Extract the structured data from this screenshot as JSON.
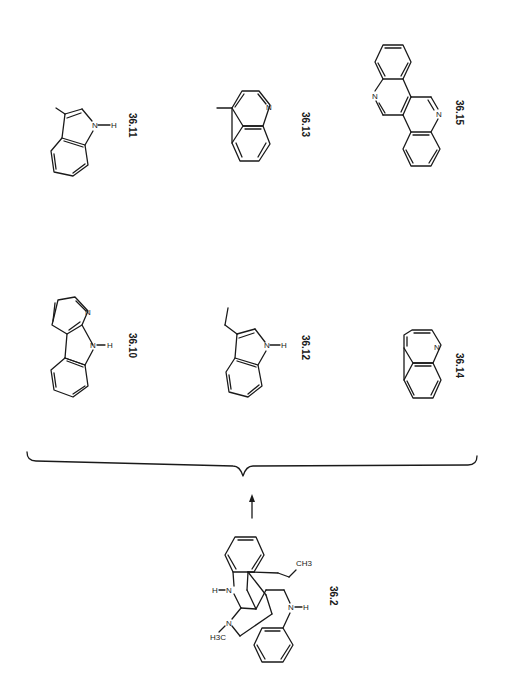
{
  "figure": {
    "orientation": "rotated-90-clockwise",
    "reactant": {
      "id": "36.2",
      "label": "36.2",
      "atoms": {
        "n1": "N",
        "h1": "H",
        "n2": "N",
        "h2": "H",
        "n3": "N",
        "n4": "N",
        "ch3_left": "H3C",
        "ch3_right": "CH3",
        "sub3": "3"
      }
    },
    "arrow": {
      "direction": "up"
    },
    "products": [
      {
        "id": "36.10",
        "label": "36.10",
        "name_hint": "alpha-carboline",
        "atoms": {
          "n_ring": "N",
          "n_h": "N",
          "h": "H"
        }
      },
      {
        "id": "36.11",
        "label": "36.11",
        "name_hint": "3-methylindole",
        "atoms": {
          "n": "N",
          "h": "H"
        }
      },
      {
        "id": "36.12",
        "label": "36.12",
        "name_hint": "3-ethylindole",
        "atoms": {
          "n": "N",
          "h": "H"
        }
      },
      {
        "id": "36.13",
        "label": "36.13",
        "name_hint": "4-methylquinoline",
        "atoms": {
          "n": "N"
        }
      },
      {
        "id": "36.14",
        "label": "36.14",
        "name_hint": "quinoline",
        "atoms": {
          "n": "N"
        }
      },
      {
        "id": "36.15",
        "label": "36.15",
        "name_hint": "dibenzonaphthyridine",
        "atoms": {
          "n1": "N",
          "n2": "N"
        }
      }
    ]
  }
}
